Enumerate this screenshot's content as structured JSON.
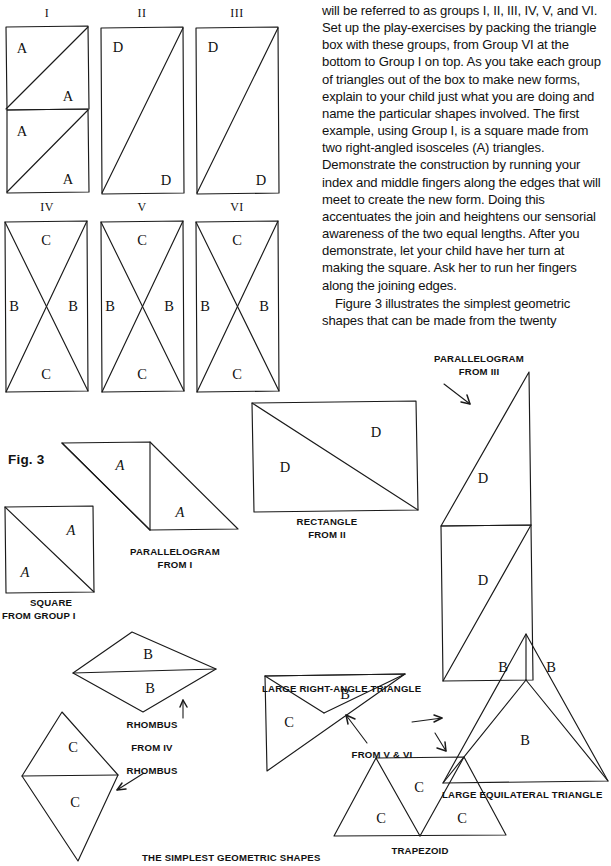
{
  "figure2": {
    "group_labels": [
      "I",
      "II",
      "III",
      "IV",
      "V",
      "VI"
    ],
    "letters": {
      "a": "A",
      "b": "B",
      "c": "C",
      "d": "D"
    }
  },
  "body": {
    "paragraph1": "will be referred to as groups I, II, III, IV, V, and VI. Set up the play-exercises by packing the triangle box with these groups, from Group VI at the bottom to Group I on top. As you take each group of triangles out of the box to make new forms, explain to your child just what you are doing and name the particular shapes involved. The first example, using Group I, is a square made from two right-angled isosceles (A) triangles. Demonstrate the construction by running your index and middle fingers along the edges that will meet to create the new form. Doing this accentuates the join and heightens our sensorial awareness of the two equal lengths. After you demonstrate, let your child have her turn at making the square. Ask her to run her fingers along the joining edges.",
    "paragraph2": "Figure 3 illustrates the simplest geometric shapes that can be made from the twenty"
  },
  "figure3": {
    "fig_label": "Fig. 3",
    "caption": "THE SIMPLEST GEOMETRIC SHAPES",
    "labels": {
      "square": "SQUARE",
      "square_from": "FROM GROUP I",
      "parallelogram_i": "PARALLELOGRAM",
      "parallelogram_i_from": "FROM I",
      "rectangle_ii": "RECTANGLE",
      "rectangle_ii_from": "FROM II",
      "parallelogram_iii": "PARALLELOGRAM",
      "parallelogram_iii_from": "FROM III",
      "rhombus_b": "RHOMBUS",
      "rhombus_b_from": "FROM IV",
      "rhombus_c": "RHOMBUS",
      "large_right_angle": "LARGE RIGHT-ANGLE TRIANGLE",
      "from_v_vi": "FROM V & VI",
      "large_equilateral": "LARGE EQUILATERAL TRIANGLE",
      "trapezoid": "TRAPEZOID"
    },
    "letters": {
      "a": "A",
      "b": "B",
      "c": "C",
      "d": "D"
    }
  },
  "colors": {
    "ink": "#1a1a1a",
    "paper": "#ffffff"
  }
}
